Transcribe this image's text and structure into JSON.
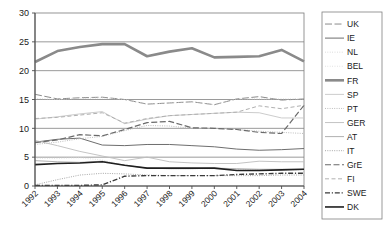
{
  "chart_data": {
    "type": "line",
    "title": "",
    "xlabel": "",
    "ylabel": "",
    "ylim": [
      0,
      30
    ],
    "ytick_step": 5,
    "yticks": [
      "0",
      "5",
      "10",
      "15",
      "20",
      "25",
      "30"
    ],
    "grid": true,
    "legend_position": "right",
    "categories": [
      "1992",
      "1993",
      "1994",
      "1995",
      "1996",
      "1997",
      "1998",
      "1999",
      "2000",
      "2001",
      "2002",
      "2003",
      "2004"
    ],
    "series": [
      {
        "name": "UK",
        "style": "long-dash",
        "color": "#8c8c8c",
        "width": 1.0,
        "values": [
          15.9,
          15.1,
          15.3,
          15.4,
          15.0,
          14.2,
          14.4,
          14.6,
          14.1,
          15.1,
          15.5,
          14.9,
          15.1
        ]
      },
      {
        "name": "IE",
        "style": "solid",
        "color": "#6e6e6e",
        "width": 1.0,
        "values": [
          7.6,
          8.1,
          8.3,
          7.1,
          7.0,
          7.2,
          7.2,
          7.0,
          6.8,
          6.4,
          6.2,
          6.3,
          6.5
        ]
      },
      {
        "name": "NL",
        "style": "dotted-fine",
        "color": "#cfcfcf",
        "width": 0.9,
        "values": [
          15.2,
          15.0,
          15.2,
          15.3,
          15.0,
          14.2,
          14.4,
          14.6,
          14.1,
          15.1,
          15.1,
          15.1,
          15.1
        ]
      },
      {
        "name": "BEL",
        "style": "dotted-fine",
        "color": "#d8d8d8",
        "width": 0.9,
        "values": [
          4.8,
          4.8,
          4.9,
          4.5,
          3.6,
          3.1,
          3.0,
          3.0,
          3.0,
          2.9,
          2.8,
          2.8,
          2.8
        ]
      },
      {
        "name": "FR",
        "style": "solid",
        "color": "#8a8a8a",
        "width": 2.6,
        "values": [
          21.5,
          23.4,
          24.1,
          24.6,
          24.6,
          22.5,
          23.3,
          23.9,
          22.3,
          22.4,
          22.5,
          23.6,
          21.6
        ]
      },
      {
        "name": "SP",
        "style": "solid",
        "color": "#c6c6c6",
        "width": 0.9,
        "values": [
          11.6,
          12.0,
          12.5,
          12.9,
          10.8,
          11.6,
          12.2,
          12.4,
          12.6,
          12.8,
          12.7,
          11.8,
          11.8
        ]
      },
      {
        "name": "PT",
        "style": "dotted",
        "color": "#b5b5b5",
        "width": 0.9,
        "values": [
          7.2,
          7.6,
          8.2,
          8.6,
          9.6,
          10.5,
          10.4,
          10.0,
          10.0,
          9.8,
          9.5,
          9.3,
          9.1
        ]
      },
      {
        "name": "GER",
        "style": "solid",
        "color": "#bdbdbd",
        "width": 0.9,
        "values": [
          7.9,
          7.0,
          6.0,
          5.2,
          4.4,
          5.0,
          4.2,
          4.0,
          3.9,
          3.9,
          4.3,
          4.2,
          4.2
        ]
      },
      {
        "name": "AT",
        "style": "solid",
        "color": "#a8a8a8",
        "width": 0.9,
        "values": [
          4.4,
          4.2,
          4.1,
          4.3,
          3.6,
          3.1,
          3.0,
          3.0,
          3.1,
          3.0,
          2.9,
          2.9,
          2.9
        ]
      },
      {
        "name": "IT",
        "style": "dotted",
        "color": "#9e9e9e",
        "width": 0.9,
        "values": [
          0.2,
          1.1,
          1.9,
          2.2,
          2.1,
          1.9,
          1.8,
          1.8,
          1.8,
          1.8,
          1.8,
          1.9,
          1.9
        ]
      },
      {
        "name": "GrE",
        "style": "dash-long",
        "color": "#6a6a6a",
        "width": 1.2,
        "values": [
          7.5,
          8.0,
          8.9,
          8.7,
          9.8,
          11.0,
          11.2,
          10.1,
          10.0,
          9.8,
          9.3,
          9.1,
          14.0
        ]
      },
      {
        "name": "FI",
        "style": "dash",
        "color": "#b0b0b0",
        "width": 1.0,
        "values": [
          11.7,
          11.9,
          12.3,
          12.7,
          10.9,
          11.7,
          12.2,
          12.4,
          12.6,
          12.8,
          13.9,
          13.4,
          14.0
        ]
      },
      {
        "name": "SWE",
        "style": "dash-dot",
        "color": "#3a3a3a",
        "width": 1.4,
        "values": [
          0.1,
          0.1,
          0.1,
          0.2,
          1.7,
          1.8,
          1.8,
          1.8,
          1.8,
          2.0,
          2.1,
          2.2,
          2.2
        ]
      },
      {
        "name": "DK",
        "style": "solid",
        "color": "#1f1f1f",
        "width": 1.6,
        "values": [
          3.7,
          3.9,
          4.0,
          4.2,
          3.6,
          3.1,
          3.1,
          3.1,
          3.1,
          2.7,
          2.7,
          2.8,
          2.9
        ]
      }
    ]
  },
  "legend": {
    "items": [
      {
        "label": "UK"
      },
      {
        "label": "IE"
      },
      {
        "label": "NL"
      },
      {
        "label": "BEL"
      },
      {
        "label": "FR"
      },
      {
        "label": "SP"
      },
      {
        "label": "PT"
      },
      {
        "label": "GER"
      },
      {
        "label": "AT"
      },
      {
        "label": "IT"
      },
      {
        "label": "GrE"
      },
      {
        "label": "FI"
      },
      {
        "label": "SWE"
      },
      {
        "label": "DK"
      }
    ]
  },
  "colors": {
    "axis": "#4d4d4d",
    "gridline": "#808080",
    "plot_border": "#7a7a7a",
    "legend_border": "#808080",
    "text": "#1a1a1a"
  }
}
